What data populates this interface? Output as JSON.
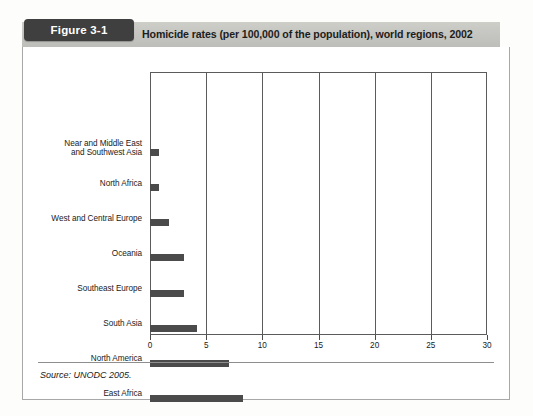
{
  "figure": {
    "badge_label": "Figure 3-1",
    "title": "Homicide rates (per 100,000 of the population), world regions, 2002",
    "source": "Source: UNODC 2005.",
    "badge_color": "#3f3f3f",
    "band_color": "#c9c9c7",
    "bar_color": "#4b4b4b"
  },
  "chart_data": {
    "type": "bar",
    "orientation": "horizontal",
    "title": "Homicide rates (per 100,000 of the population), world regions, 2002",
    "xlabel": "",
    "ylabel": "",
    "xlim": [
      0,
      30
    ],
    "xticks": [
      0,
      5,
      10,
      15,
      20,
      25,
      30
    ],
    "xtick_labels": [
      "0",
      "5",
      "10",
      "15",
      "20",
      "25",
      "30"
    ],
    "grid": true,
    "legend": false,
    "categories": [
      "Near and Middle East and Southwest Asia",
      "North Africa",
      "West and Central Europe",
      "Oceania",
      "Southeast Europe",
      "South Asia",
      "North America",
      "East Africa",
      "Central Asia and Transcaucasian countries",
      "East Europe",
      "Central America",
      "East and Southeast Asia",
      "South America",
      "Southern, West and Central Africa",
      "Caribbean"
    ],
    "category_lines": [
      [
        "Near and Middle East",
        "and Southwest Asia"
      ],
      [
        "North Africa"
      ],
      [
        "West and Central Europe"
      ],
      [
        "Oceania"
      ],
      [
        "Southeast Europe"
      ],
      [
        "South Asia"
      ],
      [
        "North America"
      ],
      [
        "East Africa"
      ],
      [
        "Central Asia and",
        "Transcaucasian countries"
      ],
      [
        "East Europe"
      ],
      [
        "Central America"
      ],
      [
        "East and Southeast Asia"
      ],
      [
        "South America"
      ],
      [
        "Southern, West",
        "and Central Africa"
      ],
      [
        "Caribbean"
      ]
    ],
    "values": [
      0.8,
      0.8,
      1.7,
      3.0,
      3.0,
      4.2,
      7.0,
      8.3,
      9.2,
      17.2,
      22.2,
      22.2,
      26.1,
      29.7,
      30.2
    ]
  }
}
